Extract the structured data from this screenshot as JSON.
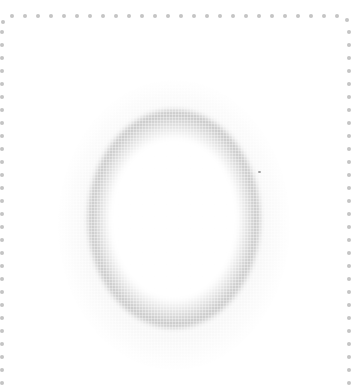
{
  "image": {
    "description": "Blurry gray halftone oval ring centered inside a dotted gray frame (top, left, right edges)",
    "colors": {
      "background": "#ffffff",
      "ring": "#bdbdbd",
      "frame_dots": "#c4c4c4"
    },
    "frame": {
      "top_dots_y": 16,
      "left_dots_x": 1,
      "right_dots_x": 349,
      "dot_spacing": 13
    },
    "ring": {
      "center_x": 174,
      "center_y": 219,
      "outer_width": 172,
      "outer_height": 218
    }
  }
}
